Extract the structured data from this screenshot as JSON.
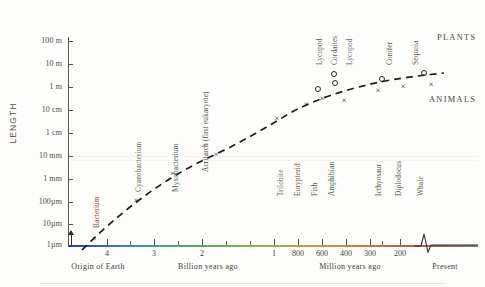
{
  "figure": {
    "y_axis_title": "LENGTH",
    "group_labels": {
      "plants": "PLANTS",
      "animals": "ANIMALS"
    },
    "x_caption_left": "Billion  years  ago",
    "x_caption_right": "Million  years  ago",
    "origin_label": "Origin of Earth",
    "present_label": "Present"
  },
  "chart_data": {
    "type": "scatter",
    "title": "",
    "subtitle": "",
    "xlabel": "Billion / Million years ago",
    "ylabel": "LENGTH",
    "grid": false,
    "legend_position": "inline-right",
    "x_axis": {
      "direction": "reversed-time",
      "break_before_present": true,
      "ticks_billion": [
        "4",
        "3",
        "2",
        "1"
      ],
      "ticks_million": [
        "800",
        "600",
        "400",
        "300",
        "200"
      ],
      "origin_marker": {
        "label": "Origin of Earth",
        "value_ga": 4.6
      },
      "present_marker": {
        "label": "Present",
        "value_ma": 0
      }
    },
    "y_axis": {
      "scale": "log",
      "tick_labels": [
        "100 m",
        "10 m",
        "1 m",
        "10 cm",
        "1 cm",
        "10 mm",
        "1 mm",
        "100µm",
        "10µm",
        "1µm"
      ],
      "ylim_label_min": "1µm",
      "ylim_label_max": "100 m"
    },
    "series": [
      {
        "name": "ANIMALS",
        "marker": "x",
        "points": [
          {
            "label": "Bacterium",
            "time": "3.5 Ga",
            "size": "1µm",
            "px": [
              94,
              238
            ]
          },
          {
            "label": "Cyanobacterium",
            "time": "2.8 Ga",
            "size": "10µm",
            "px": [
              136,
              200
            ]
          },
          {
            "label": "Myxobacterium",
            "time": "2.1 Ga",
            "size": "100µm",
            "px": [
              173,
              173
            ]
          },
          {
            "label": "Acritarch (first eukaryote)",
            "time": "1.4 Ga",
            "size": "1 mm",
            "px": [
              216,
              154
            ]
          },
          {
            "label": "Trilobite",
            "time": "540 Ma",
            "size": "10 cm",
            "px": [
              277,
              118
            ]
          },
          {
            "label": "Eurypterid",
            "time": "440 Ma",
            "size": "1 m",
            "px": [
              306,
              104
            ]
          },
          {
            "label": "Fish",
            "time": "410 Ma",
            "size": "1 m",
            "px": [
              322,
              98
            ]
          },
          {
            "label": "Amphibian",
            "time": "350 Ma",
            "size": "2 m",
            "px": [
              344,
              100
            ]
          },
          {
            "label": "Icthyosaur",
            "time": "230 Ma",
            "size": "4 m",
            "px": [
              378,
              90
            ]
          },
          {
            "label": "Diplodocus",
            "time": "150 Ma",
            "size": "25 m",
            "px": [
              403,
              86
            ]
          },
          {
            "label": "Whale",
            "time": "Present",
            "size": "30 m",
            "px": [
              431,
              84
            ]
          }
        ]
      },
      {
        "name": "PLANTS",
        "marker": "o",
        "points": [
          {
            "label": "Lycopod",
            "time": "400 Ma",
            "size": "1 m",
            "px": [
              317,
              88
            ]
          },
          {
            "label": "Cordaites",
            "time": "330 Ma",
            "size": "10 m",
            "px": [
              333,
              73
            ]
          },
          {
            "label": "Lycopod",
            "time": "310 Ma",
            "size": "8 m",
            "px": [
              334,
              82
            ]
          },
          {
            "label": "Conifer",
            "time": "190 Ma",
            "size": "20 m",
            "px": [
              381,
              78
            ]
          },
          {
            "label": "Sequoia",
            "time": "Present",
            "size": "90 m",
            "px": [
              423,
              72
            ]
          }
        ]
      }
    ],
    "trend_curve": {
      "style": "dashed",
      "description": "rising logistic-like envelope of maximum organism length through time"
    },
    "annotations": [
      {
        "text": "PLANTS",
        "px": [
          437,
          38
        ]
      },
      {
        "text": "ANIMALS",
        "px": [
          432,
          100
        ]
      }
    ]
  },
  "y_ticks": [
    {
      "label": "100 m",
      "y": 41
    },
    {
      "label": "10 m",
      "y": 64
    },
    {
      "label": "1 m",
      "y": 87
    },
    {
      "label": "10 cm",
      "y": 110
    },
    {
      "label": "1 cm",
      "y": 133
    },
    {
      "label": "10 mm",
      "y": 156
    },
    {
      "label": "1 mm",
      "y": 179
    },
    {
      "label": "100µm",
      "y": 202
    },
    {
      "label": "10µm",
      "y": 224
    },
    {
      "label": "1µm",
      "y": 245
    }
  ],
  "x_ticks": [
    {
      "label": "4",
      "x": 107,
      "major": true
    },
    {
      "label": "",
      "x": 130,
      "major": false
    },
    {
      "label": "3",
      "x": 154,
      "major": true
    },
    {
      "label": "",
      "x": 178,
      "major": false
    },
    {
      "label": "2",
      "x": 202,
      "major": true
    },
    {
      "label": "",
      "x": 226,
      "major": false
    },
    {
      "label": "",
      "x": 250,
      "major": false
    },
    {
      "label": "1",
      "x": 274,
      "major": true
    },
    {
      "label": "800",
      "x": 298,
      "major": true
    },
    {
      "label": "600",
      "x": 322,
      "major": true
    },
    {
      "label": "400",
      "x": 346,
      "major": true
    },
    {
      "label": "300",
      "x": 370,
      "major": true
    },
    {
      "label": "",
      "x": 382,
      "major": false
    },
    {
      "label": "200",
      "x": 400,
      "major": true
    }
  ],
  "specimen_labels": [
    {
      "text": "Bacterium",
      "x": 92,
      "y": 228,
      "color": "#8a4a3a"
    },
    {
      "text": "Cyanobacterium",
      "x": 134,
      "y": 192,
      "color": "#5f6a4e"
    },
    {
      "text": "Myxobacterium",
      "x": 171,
      "y": 192,
      "color": "#4a5a55"
    },
    {
      "text": "Acritarch (first eukaryote)",
      "x": 201,
      "y": 172,
      "color": "#4b4a44"
    },
    {
      "text": "Trilobite",
      "x": 276,
      "y": 196,
      "color": "#5a6a50"
    },
    {
      "text": "Eurypterid",
      "x": 293,
      "y": 196,
      "color": "#7a4d3e"
    },
    {
      "text": "Fish",
      "x": 310,
      "y": 196,
      "color": "#4a5550"
    },
    {
      "text": "Amphibian",
      "x": 327,
      "y": 196,
      "color": "#3f5a47"
    },
    {
      "text": "Icthyosaur",
      "x": 374,
      "y": 196,
      "color": "#4d4c46"
    },
    {
      "text": "Diplodocus",
      "x": 394,
      "y": 196,
      "color": "#4a4a44"
    },
    {
      "text": "Whale",
      "x": 416,
      "y": 196,
      "color": "#5b6a3f"
    }
  ],
  "plant_labels": [
    {
      "text": "Lycopod",
      "x": 315,
      "y": 65,
      "color": "#5d5c50"
    },
    {
      "text": "Cordaites",
      "x": 330,
      "y": 65,
      "color": "#4b5a55"
    },
    {
      "text": "Lycopod",
      "x": 345,
      "y": 65,
      "color": "#5a6a72"
    },
    {
      "text": "Conifer",
      "x": 385,
      "y": 65,
      "color": "#4f5a48"
    },
    {
      "text": "Sequoia",
      "x": 411,
      "y": 65,
      "color": "#57564c"
    }
  ],
  "colors": {
    "axis": "#57564f",
    "text": "#3a3a38",
    "curve": "#1d1d1b",
    "band_mm": "#e8e4b8",
    "background": "#fdfdfb"
  }
}
